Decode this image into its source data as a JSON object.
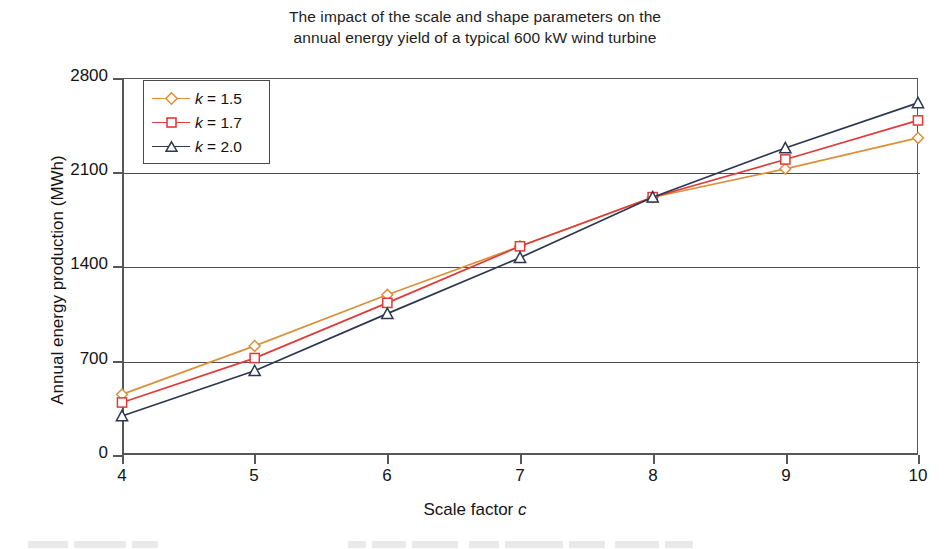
{
  "chart_data": {
    "type": "line",
    "title": "The impact of the scale and shape parameters on the annual energy yield of a typical 600 kW wind turbine",
    "title_line1": "The impact of the scale and shape parameters on the",
    "title_line2": "annual energy yield of a typical 600 kW wind turbine",
    "xlabel": "Scale factor c",
    "xlabel_text": "Scale factor",
    "xlabel_symbol": "c",
    "ylabel": "Annual energy production (MWh)",
    "x": [
      4,
      5,
      6,
      7,
      8,
      9,
      10
    ],
    "xticklabels": [
      "4",
      "5",
      "6",
      "7",
      "8",
      "9",
      "10"
    ],
    "yticklabels": [
      "0",
      "700",
      "1400",
      "2100",
      "2800"
    ],
    "yticks": [
      0,
      700,
      1400,
      2100,
      2800
    ],
    "xlim": [
      4,
      10
    ],
    "ylim": [
      0,
      2800
    ],
    "grid": "horizontal",
    "legend_position": "upper-left-inside",
    "series": [
      {
        "name": "k = 1.5",
        "label_prefix": "k",
        "label_value": "= 1.5",
        "color": "#D9913C",
        "marker": "diamond",
        "values": [
          450,
          810,
          1190,
          1550,
          1915,
          2125,
          2355
        ]
      },
      {
        "name": "k = 1.7",
        "label_prefix": "k",
        "label_value": "= 1.7",
        "color": "#DE3B39",
        "marker": "square",
        "values": [
          390,
          720,
          1130,
          1550,
          1915,
          2195,
          2485
        ]
      },
      {
        "name": "k = 2.0",
        "label_prefix": "k",
        "label_value": "= 2.0",
        "color": "#2E3752",
        "marker": "triangle",
        "values": [
          290,
          625,
          1050,
          1465,
          1915,
          2280,
          2615
        ]
      }
    ]
  },
  "colors": {
    "axis": "#575757",
    "grid": "#4d4d4d",
    "text": "#141414",
    "background": "#ffffff"
  }
}
